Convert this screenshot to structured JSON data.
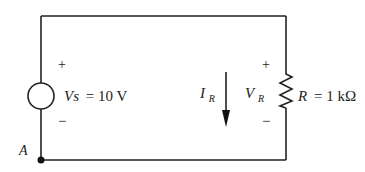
{
  "diagram": {
    "type": "circuit",
    "source": {
      "symbol": "Vs",
      "equals": "= 10 V",
      "polarity_plus": "+",
      "polarity_minus": "−"
    },
    "resistor": {
      "symbol": "R",
      "equals": "= 1 kΩ",
      "polarity_plus": "+",
      "polarity_minus": "−"
    },
    "current": {
      "symbol": "I",
      "subscript": "R",
      "direction": "down"
    },
    "voltage": {
      "symbol": "V",
      "subscript": "R"
    },
    "node": {
      "label": "A"
    }
  }
}
